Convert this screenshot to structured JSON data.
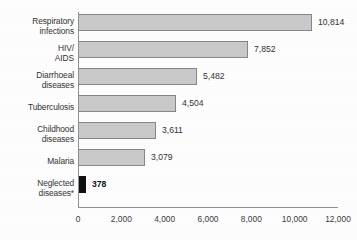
{
  "chart_data": {
    "type": "bar",
    "orientation": "horizontal",
    "title": "",
    "subtitle": "",
    "xlabel": "",
    "ylabel": "",
    "categories": [
      "Respiratory\ninfections",
      "HIV/\nAIDS",
      "Diarrhoeal\ndiseases",
      "Tuberculosis",
      "Childhood\ndiseases",
      "Malaria",
      "Neglected\ndiseases*"
    ],
    "values": [
      10814,
      7852,
      5482,
      4504,
      3611,
      3079,
      378
    ],
    "value_labels": [
      "10,814",
      "7,852",
      "5,482",
      "4,504",
      "3,611",
      "3,079",
      "378"
    ],
    "highlight_index": 6,
    "xlim": [
      0,
      12000
    ],
    "xticks": [
      0,
      2000,
      4000,
      6000,
      8000,
      10000,
      12000
    ],
    "xtick_labels": [
      "0",
      "2,000",
      "4,000",
      "6,000",
      "8,000",
      "10,000",
      "12,000"
    ],
    "grid": false,
    "legend": false,
    "colors": {
      "bar_fill": "#c9c9c9",
      "bar_border": "#868686",
      "highlight_fill": "#101010",
      "axis": "#8f8f8f",
      "text": "#333333",
      "background": "#fdfdfd"
    }
  },
  "axis": {
    "x_origin_px": 78,
    "x_end_px": 338,
    "baseline_px": 207
  }
}
